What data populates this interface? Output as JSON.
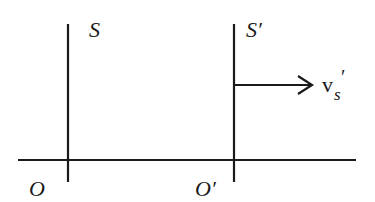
{
  "diagram": {
    "type": "reference-frames",
    "stroke_color": "#1a1a1a",
    "background": "#ffffff",
    "frames": [
      {
        "name": "S",
        "frame_label": "S",
        "origin_label": "O",
        "axis_x": 68
      },
      {
        "name": "S-prime",
        "frame_label": "S′",
        "origin_label": "O′",
        "axis_x": 234
      }
    ],
    "horizontal_axis": {
      "y": 160,
      "x_start": 18,
      "x_end": 356
    },
    "velocity": {
      "symbol": "v",
      "subscript": "s",
      "prime": "′",
      "direction": "right"
    }
  }
}
